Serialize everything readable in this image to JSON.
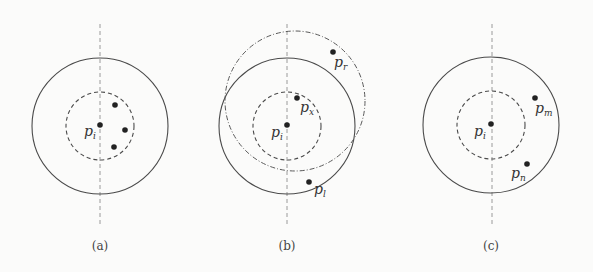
{
  "panels": [
    {
      "id": "a",
      "caption": "(a)",
      "center_label": {
        "base": "p",
        "sub": "i"
      },
      "points": []
    },
    {
      "id": "b",
      "caption": "(b)",
      "center_label": {
        "base": "p",
        "sub": "i"
      },
      "points": [
        {
          "base": "p",
          "sub": "x"
        },
        {
          "base": "p",
          "sub": "r"
        },
        {
          "base": "p",
          "sub": "l"
        }
      ]
    },
    {
      "id": "c",
      "caption": "(c)",
      "center_label": {
        "base": "p",
        "sub": "i"
      },
      "points": [
        {
          "base": "p",
          "sub": "m"
        },
        {
          "base": "p",
          "sub": "n"
        }
      ]
    }
  ],
  "colors": {
    "stroke": "#4a4a4a",
    "axis": "#9a9a9a",
    "dot": "#222222"
  }
}
